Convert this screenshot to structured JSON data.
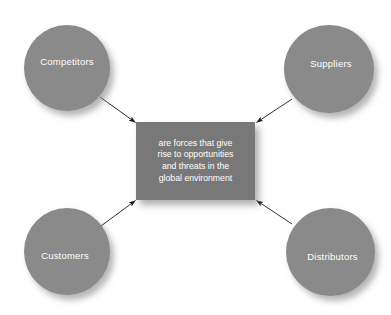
{
  "diagram": {
    "type": "hub-and-spoke",
    "background_color": "#ffffff",
    "node_fill_color": "#8a8a8a",
    "center_fill_color": "#787878",
    "label_color": "#ffffff",
    "arrow_color": "#1a1a1a",
    "center": {
      "name": "center-statement-box",
      "lines": [
        "are forces that give",
        "rise to opportunities",
        "and threats in the",
        "global environment"
      ]
    },
    "nodes": [
      {
        "id": "competitors",
        "label": "Competitors",
        "position": "top-left"
      },
      {
        "id": "suppliers",
        "label": "Suppliers",
        "position": "top-right"
      },
      {
        "id": "customers",
        "label": "Customers",
        "position": "bottom-left"
      },
      {
        "id": "distributors",
        "label": "Distributors",
        "position": "bottom-right"
      }
    ],
    "arrows": [
      {
        "from": "competitors",
        "to": "center-statement-box",
        "direction": "down-right"
      },
      {
        "from": "suppliers",
        "to": "center-statement-box",
        "direction": "down-left"
      },
      {
        "from": "customers",
        "to": "center-statement-box",
        "direction": "up-right"
      },
      {
        "from": "distributors",
        "to": "center-statement-box",
        "direction": "up-left"
      }
    ]
  }
}
